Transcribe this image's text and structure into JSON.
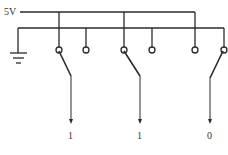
{
  "diagram": {
    "supply_label": "5V",
    "ground_symbol": "ground-icon",
    "stroke_color": "#2a2a2a",
    "switches": [
      {
        "position": 1,
        "state": "closed-to-5V",
        "output": "1"
      },
      {
        "position": 2,
        "state": "closed-to-5V",
        "output": "1"
      },
      {
        "position": 3,
        "state": "closed-to-ground",
        "output": "0"
      }
    ]
  }
}
